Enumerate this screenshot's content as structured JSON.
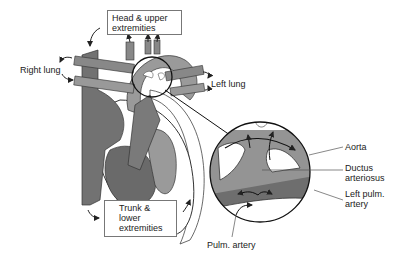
{
  "diagram": {
    "type": "fetal circulation heart schematic with magnified inset",
    "labels": {
      "head_upper": [
        "Head & upper",
        "extremities"
      ],
      "right_lung": "Right lung",
      "left_lung": "Left lung",
      "trunk_lower": [
        "Trunk &",
        "lower",
        "extremities"
      ],
      "aorta": "Aorta",
      "ductus": [
        "Ductus",
        "arteriosus"
      ],
      "left_pulm": [
        "Left pulm.",
        "artery"
      ],
      "pulm_artery": "Pulm. artery"
    },
    "colors": {
      "dark_vessel": "#6e6e6e",
      "mid_vessel": "#8e8e8e",
      "light_vessel": "#a8a8a8",
      "outline": "#1a1a1a",
      "background": "#ffffff"
    }
  }
}
